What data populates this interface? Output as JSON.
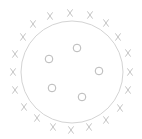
{
  "diagram": {
    "boundary_circle": {
      "cx": 72,
      "cy": 72,
      "r": 51,
      "stroke": "#d4d4d4",
      "stroke_width": 1
    },
    "inner_points": {
      "shape": "circle-marker",
      "r": 3.8,
      "stroke": "#b8b8b8",
      "points": [
        {
          "x": 77,
          "y": 48
        },
        {
          "x": 49,
          "y": 59
        },
        {
          "x": 99,
          "y": 71
        },
        {
          "x": 52,
          "y": 88
        },
        {
          "x": 82,
          "y": 97
        }
      ]
    },
    "outer_points": {
      "shape": "x-marker",
      "stroke": "#c4c4c4",
      "half_w": 2.6,
      "half_h": 3.6,
      "points": [
        {
          "x": 50,
          "y": 16
        },
        {
          "x": 70,
          "y": 13
        },
        {
          "x": 90,
          "y": 15
        },
        {
          "x": 106,
          "y": 23
        },
        {
          "x": 118,
          "y": 37
        },
        {
          "x": 128,
          "y": 53
        },
        {
          "x": 130,
          "y": 72
        },
        {
          "x": 128,
          "y": 90
        },
        {
          "x": 120,
          "y": 108
        },
        {
          "x": 106,
          "y": 120
        },
        {
          "x": 89,
          "y": 127
        },
        {
          "x": 71,
          "y": 130
        },
        {
          "x": 53,
          "y": 127
        },
        {
          "x": 37,
          "y": 118
        },
        {
          "x": 24,
          "y": 107
        },
        {
          "x": 15,
          "y": 90
        },
        {
          "x": 13,
          "y": 72
        },
        {
          "x": 15,
          "y": 54
        },
        {
          "x": 23,
          "y": 37
        },
        {
          "x": 33,
          "y": 24
        }
      ]
    }
  }
}
